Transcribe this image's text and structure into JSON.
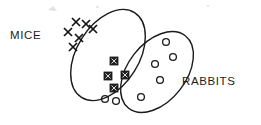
{
  "diagram": {
    "type": "venn-diagram",
    "background_color": "#ffffff",
    "stroke_color": "#1a1a1a",
    "sets": [
      {
        "id": "mice",
        "label": "MICE",
        "label_x": 10,
        "label_y": 39,
        "marker": "x-mark",
        "marker_meaning": "mouse",
        "ellipse": {
          "cx": 108,
          "cy": 55,
          "rx": 50,
          "ry": 31,
          "rotation": -58
        }
      },
      {
        "id": "rabbits",
        "label": "RABBITS",
        "label_x": 182,
        "label_y": 85,
        "marker": "open-circle",
        "marker_meaning": "rabbit",
        "ellipse": {
          "cx": 157,
          "cy": 72,
          "rx": 46,
          "ry": 29,
          "rotation": -52
        }
      }
    ],
    "regions": [
      {
        "id": "mice-only",
        "marker": "x-mark",
        "count": 6
      },
      {
        "id": "intersection",
        "marker": "x-in-box",
        "count": 4
      },
      {
        "id": "rabbits-only",
        "marker": "open-circle",
        "count": 7
      }
    ],
    "markers": {
      "mice_only_x": [
        {
          "x": 68,
          "y": 32
        },
        {
          "x": 76,
          "y": 22
        },
        {
          "x": 86,
          "y": 24
        },
        {
          "x": 93,
          "y": 29
        },
        {
          "x": 79,
          "y": 38
        },
        {
          "x": 73,
          "y": 47
        }
      ],
      "intersection_boxes": [
        {
          "x": 114,
          "y": 61
        },
        {
          "x": 108,
          "y": 76
        },
        {
          "x": 125,
          "y": 75
        },
        {
          "x": 114,
          "y": 88
        }
      ],
      "rabbits_only_circles": [
        {
          "x": 166,
          "y": 42
        },
        {
          "x": 173,
          "y": 57
        },
        {
          "x": 155,
          "y": 64
        },
        {
          "x": 160,
          "y": 80
        },
        {
          "x": 141,
          "y": 97
        },
        {
          "x": 105,
          "y": 99
        },
        {
          "x": 116,
          "y": 101
        }
      ]
    }
  }
}
